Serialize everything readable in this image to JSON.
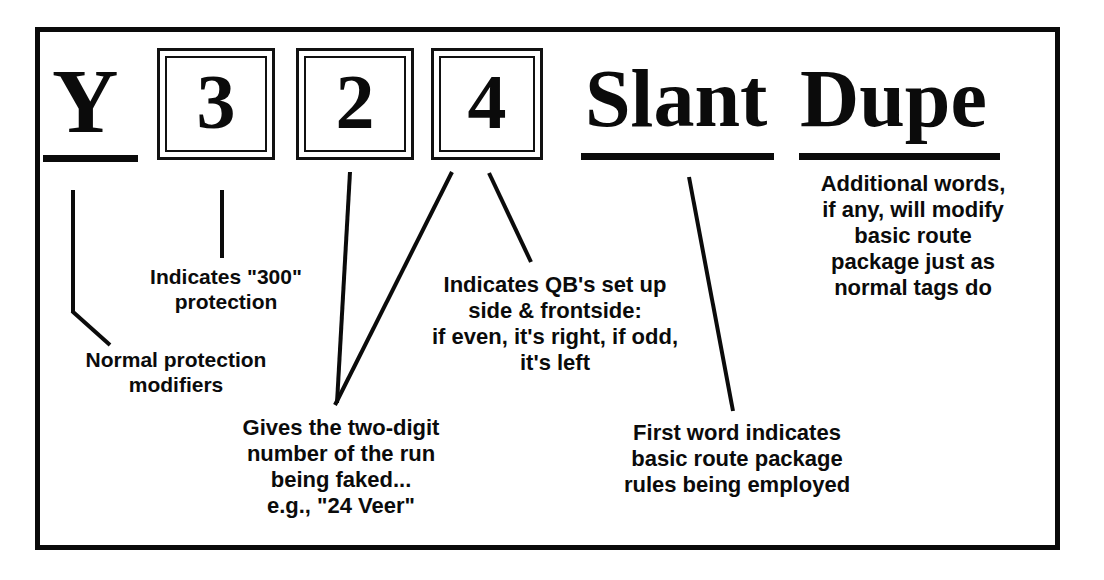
{
  "diagram": {
    "title": "Y 3 2 4 Slant Dupe",
    "frame_color": "#0a0a0a",
    "ink_color": "#0b0b0b",
    "header": {
      "letter": "Y",
      "boxes": [
        {
          "digit": "3"
        },
        {
          "digit": "2"
        },
        {
          "digit": "4"
        }
      ],
      "words": [
        {
          "text": "Slant"
        },
        {
          "text": "Dupe"
        }
      ]
    },
    "annotations": {
      "normal_protection": "Normal protection\nmodifiers",
      "protection_300": "Indicates \"300\"\nprotection",
      "two_digit_run": "Gives the two-digit\nnumber of the run\nbeing faked...\ne.g., \"24 Veer\"",
      "qb_setup": "Indicates QB's set up\nside & frontside:\nif even, it's right, if odd,\nit's left",
      "first_word": "First word indicates\nbasic route package\nrules being employed",
      "additional_words": "Additional words,\nif any, will modify\nbasic route\npackage just as\nnormal tags do"
    }
  }
}
